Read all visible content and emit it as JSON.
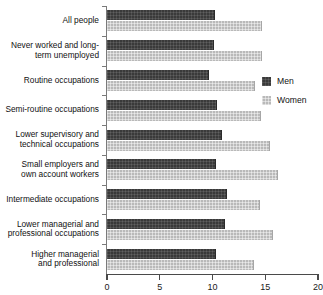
{
  "chart_data": {
    "type": "bar",
    "orientation": "horizontal",
    "title": "",
    "subtitle": "",
    "xlabel": "",
    "ylabel": "",
    "xlim": [
      0,
      20
    ],
    "xticks": [
      0,
      5,
      10,
      15,
      20
    ],
    "xtick_labels": [
      "0",
      "5",
      "10",
      "15",
      "20"
    ],
    "grid": false,
    "legend_position": "right",
    "categories": [
      "All people",
      "Never worked and long-\nterm unemployed",
      "Routine occupations",
      "Semi-routine occupations",
      "Lower supervisory and\ntechnical occupations",
      "Small employers and\nown account workers",
      "Intermediate occupations",
      "Lower managerial and\nprofessional occupations",
      "Higher managerial\nand professional"
    ],
    "series": [
      {
        "name": "Men",
        "color": "#3a3a3a",
        "values": [
          10.1,
          10.0,
          9.6,
          10.3,
          10.8,
          10.2,
          11.3,
          11.1,
          10.2
        ]
      },
      {
        "name": "Women",
        "color": "#b9b9b9",
        "values": [
          14.6,
          14.6,
          13.9,
          14.5,
          15.4,
          16.1,
          14.4,
          15.6,
          13.8
        ]
      }
    ]
  },
  "legend": {
    "items": [
      {
        "label": "Men",
        "swatch": "men"
      },
      {
        "label": "Women",
        "swatch": "women"
      }
    ]
  }
}
